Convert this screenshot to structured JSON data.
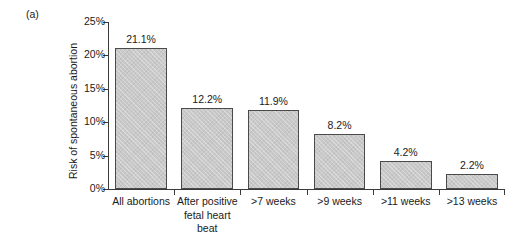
{
  "panel": {
    "label": "(a)"
  },
  "chart_data": {
    "type": "bar",
    "title": "",
    "xlabel": "",
    "ylabel": "Risk of spontaneous abortion",
    "ylim": [
      0,
      25
    ],
    "yticks": [
      "0%",
      "5%",
      "10%",
      "15%",
      "20%",
      "25%"
    ],
    "ytick_values": [
      0,
      5,
      10,
      15,
      20,
      25
    ],
    "grid": false,
    "legend": null,
    "units": "percent",
    "categories": [
      "All abortions",
      "After positive fetal heart beat",
      ">7 weeks",
      ">9 weeks",
      ">11 weeks",
      ">13 weeks"
    ],
    "category_lines": [
      [
        "All abortions"
      ],
      [
        "After positive",
        "fetal heart",
        "beat"
      ],
      [
        ">7 weeks"
      ],
      [
        ">9 weeks"
      ],
      [
        ">11 weeks"
      ],
      [
        ">13 weeks"
      ]
    ],
    "values": [
      21.1,
      12.2,
      11.9,
      8.2,
      4.2,
      2.2
    ],
    "data_labels": [
      "21.1%",
      "12.2%",
      "11.9%",
      "8.2%",
      "4.2%",
      "2.2%"
    ],
    "bar_fill_color": "#c9c9c9",
    "bar_edge_color": "#4a4a4a",
    "axis_color": "#3a3a3a"
  }
}
